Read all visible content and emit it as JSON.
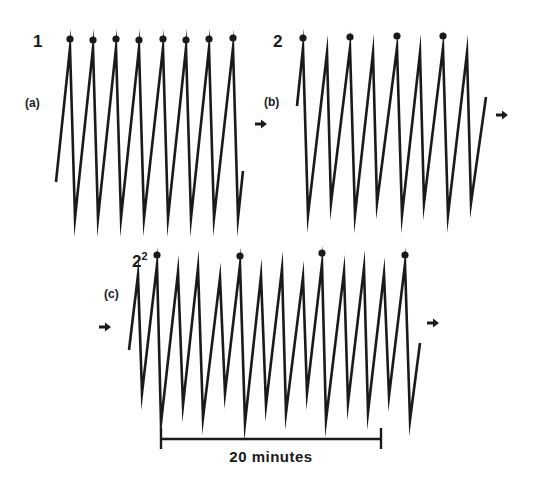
{
  "figure": {
    "ink_color": "#1a1a1a",
    "background": "#ffffff",
    "panels": [
      {
        "id": "a",
        "label": "(a)",
        "period_label": "1",
        "period_sup": "",
        "label_pos": [
          25,
          107
        ],
        "period_pos": [
          33,
          47
        ],
        "trace": [
          [
            56,
            182
          ],
          [
            70,
            48
          ],
          [
            75,
            218
          ],
          [
            93,
            48
          ],
          [
            98,
            218
          ],
          [
            116,
            48
          ],
          [
            121,
            218
          ],
          [
            139,
            48
          ],
          [
            144,
            218
          ],
          [
            163,
            48
          ],
          [
            168,
            218
          ],
          [
            186,
            48
          ],
          [
            191,
            218
          ],
          [
            209,
            48
          ],
          [
            214,
            218
          ],
          [
            233,
            48
          ],
          [
            238,
            218
          ],
          [
            243,
            171
          ]
        ],
        "dots": [
          [
            70,
            39
          ],
          [
            93,
            40
          ],
          [
            116,
            39
          ],
          [
            139,
            40
          ],
          [
            163,
            39
          ],
          [
            186,
            40
          ],
          [
            209,
            39
          ],
          [
            233,
            38
          ]
        ],
        "arrow_out": [
          262,
          124
        ]
      },
      {
        "id": "b",
        "label": "(b)",
        "period_label": "2",
        "period_sup": "",
        "label_pos": [
          264,
          106
        ],
        "period_pos": [
          273,
          47
        ],
        "trace": [
          [
            297,
            106
          ],
          [
            303,
            48
          ],
          [
            308,
            215
          ],
          [
            327,
            53
          ],
          [
            331,
            203
          ],
          [
            350,
            48
          ],
          [
            355,
            215
          ],
          [
            373,
            53
          ],
          [
            377,
            203
          ],
          [
            397,
            48
          ],
          [
            402,
            215
          ],
          [
            420,
            53
          ],
          [
            424,
            203
          ],
          [
            443,
            48
          ],
          [
            448,
            215
          ],
          [
            467,
            53
          ],
          [
            471,
            203
          ],
          [
            486,
            97
          ]
        ],
        "dots": [
          [
            303,
            38
          ],
          [
            350,
            37
          ],
          [
            397,
            36
          ],
          [
            443,
            36
          ]
        ],
        "arrow_out": [
          503,
          115
        ]
      },
      {
        "id": "c",
        "label": "(c)",
        "period_label": "2",
        "period_sup": "2",
        "label_pos": [
          104,
          298
        ],
        "period_pos": [
          132,
          267
        ],
        "arrow_in": [
          106,
          327
        ],
        "trace": [
          [
            129,
            350
          ],
          [
            138,
            275
          ],
          [
            142,
            393
          ],
          [
            157,
            265
          ],
          [
            161,
            423
          ],
          [
            178,
            272
          ],
          [
            183,
            405
          ],
          [
            198,
            268
          ],
          [
            203,
            418
          ],
          [
            220,
            278
          ],
          [
            225,
            393
          ],
          [
            240,
            265
          ],
          [
            245,
            423
          ],
          [
            261,
            276
          ],
          [
            266,
            405
          ],
          [
            282,
            269
          ],
          [
            286,
            413
          ],
          [
            303,
            277
          ],
          [
            307,
            393
          ],
          [
            322,
            264
          ],
          [
            326,
            420
          ],
          [
            344,
            272
          ],
          [
            348,
            403
          ],
          [
            364,
            268
          ],
          [
            368,
            412
          ],
          [
            384,
            274
          ],
          [
            389,
            396
          ],
          [
            405,
            264
          ],
          [
            410,
            420
          ],
          [
            420,
            343
          ]
        ],
        "dots": [
          [
            157,
            255
          ],
          [
            240,
            256
          ],
          [
            322,
            253
          ],
          [
            405,
            255
          ]
        ],
        "arrow_out": [
          434,
          323
        ]
      }
    ],
    "scale_bar": {
      "x1": 161,
      "x2": 381,
      "y": 439,
      "label": "20 minutes",
      "label_pos": [
        271,
        462
      ]
    }
  }
}
